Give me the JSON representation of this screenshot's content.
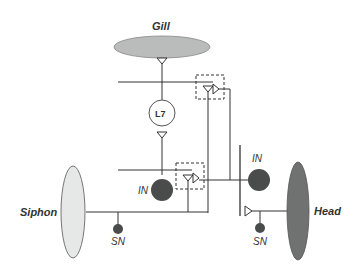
{
  "diagram": {
    "nodes": {
      "gill": {
        "label": "Gill",
        "fill": "#b9bcbb"
      },
      "siphon": {
        "label": "Siphon",
        "fill": "#e6e8e8"
      },
      "head": {
        "label": "Head",
        "fill": "#707271"
      },
      "l7": {
        "label": "L7",
        "fill": "#ffffff"
      },
      "in_left": {
        "label": "IN",
        "fill": "#4a4c4c"
      },
      "in_right": {
        "label": "IN",
        "fill": "#4a4c4c"
      },
      "sn_left": {
        "label": "SN",
        "fill": "#4a4c4c"
      },
      "sn_right": {
        "label": "SN",
        "fill": "#4a4c4c"
      }
    },
    "colors": {
      "line": "#333333",
      "dashed_box": "#333333"
    }
  }
}
